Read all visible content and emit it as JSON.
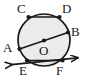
{
  "figure": {
    "type": "circle-geometry-diagram",
    "background_color": "#ffffff",
    "stroke_color": "#1a1a1a",
    "circle_fill_color": "#ebebeb",
    "circle": {
      "center_label": "O",
      "center_x": 44,
      "center_y": 40,
      "radius": 26
    },
    "points": [
      {
        "id": "C",
        "label": "C",
        "x": 28.5,
        "y": 17.0,
        "dot": true,
        "label_x": 17,
        "label_y": 3
      },
      {
        "id": "D",
        "label": "D",
        "x": 59.5,
        "y": 17.0,
        "dot": true,
        "label_x": 62,
        "label_y": 3
      },
      {
        "id": "A",
        "label": "A",
        "x": 19.5,
        "y": 49.0,
        "dot": true,
        "label_x": 4,
        "label_y": 38
      },
      {
        "id": "B",
        "label": "B",
        "x": 68.0,
        "y": 32.5,
        "dot": true,
        "label_x": 71,
        "label_y": 25
      },
      {
        "id": "O",
        "label": "O",
        "x": 44.0,
        "y": 40.5,
        "dot": true,
        "label_x": 40,
        "label_y": 42
      },
      {
        "id": "E",
        "label": "E",
        "x": 27.0,
        "y": 60.5,
        "dot": true,
        "label_x": 19,
        "label_y": 63
      },
      {
        "id": "F",
        "label": "F",
        "x": 62.5,
        "y": 60.5,
        "dot": true,
        "label_x": 56,
        "label_y": 63
      }
    ],
    "segments": [
      {
        "id": "CD",
        "name": "chord-cd",
        "from": "C",
        "to": "D",
        "x1": 28.5,
        "y1": 17.0,
        "x2": 59.5,
        "y2": 17.0,
        "arrow_start": false,
        "arrow_end": false
      },
      {
        "id": "AB",
        "name": "chord-ab-through-center",
        "from": "A",
        "to": "B",
        "x1": 19.5,
        "y1": 49.0,
        "x2": 68.0,
        "y2": 32.5,
        "arrow_start": false,
        "arrow_end": false
      },
      {
        "id": "EF",
        "name": "line-ef-extended",
        "from": "E",
        "to": "F",
        "x1": 27.0,
        "y1": 60.5,
        "x2": 62.5,
        "y2": 60.5,
        "arrow_start": true,
        "arrow_end": true,
        "extend_start_x": 9.0,
        "extend_start_y": 66.0,
        "extend_end_x": 80.0,
        "extend_end_y": 57.0
      }
    ],
    "labels": {
      "A": "A",
      "B": "B",
      "C": "C",
      "D": "D",
      "E": "E",
      "F": "F",
      "O": "O"
    }
  }
}
